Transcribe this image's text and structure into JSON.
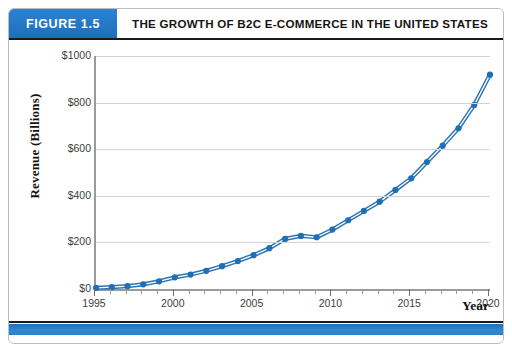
{
  "figure": {
    "tag": "FIGURE 1.5",
    "title": "THE GROWTH OF B2C E-COMMERCE IN THE UNITED STATES",
    "accent_color": "#2176c7",
    "line_color": "#2e75b6",
    "marker_color": "#1f6fb5",
    "gridline_color": "#d2d2d2",
    "axis_color": "#9a9a9a"
  },
  "chart_data": {
    "type": "line",
    "title": "THE GROWTH OF B2C E-COMMERCE IN THE UNITED STATES",
    "xlabel": "Year",
    "ylabel": "Revenue (Billions)",
    "xlim": [
      1995,
      2020
    ],
    "ylim": [
      0,
      1000
    ],
    "grid": true,
    "legend": "none",
    "y_ticks": [
      0,
      200,
      400,
      600,
      800,
      1000
    ],
    "y_tick_labels": [
      "$0",
      "$200",
      "$400",
      "$600",
      "$800",
      "$1000"
    ],
    "x_ticks": [
      1995,
      2000,
      2005,
      2010,
      2015,
      2020
    ],
    "x_tick_labels": [
      "1995",
      "2000",
      "2005",
      "2010",
      "2015",
      "2020"
    ],
    "x_minor_tick_step": 1,
    "marker": "circle",
    "series": [
      {
        "name": "B2C E-commerce Revenue",
        "x": [
          1995,
          1996,
          1997,
          1998,
          1999,
          2000,
          2001,
          2002,
          2003,
          2004,
          2005,
          2006,
          2007,
          2008,
          2009,
          2010,
          2011,
          2012,
          2013,
          2014,
          2015,
          2016,
          2017,
          2018,
          2019,
          2020
        ],
        "values": [
          5,
          8,
          12,
          20,
          33,
          50,
          62,
          78,
          98,
          120,
          145,
          175,
          215,
          228,
          222,
          255,
          295,
          335,
          375,
          425,
          475,
          545,
          615,
          690,
          790,
          920
        ]
      }
    ]
  }
}
